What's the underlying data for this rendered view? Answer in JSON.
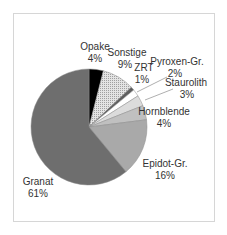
{
  "chart_data": {
    "type": "pie",
    "title": "",
    "start_angle_deg": 0,
    "direction": "clockwise",
    "slices": [
      {
        "label": "Opake",
        "value": 4,
        "pct_label": "4%",
        "color": "#000000",
        "pattern": "solid"
      },
      {
        "label": "Sonstige",
        "value": 9,
        "pct_label": "9%",
        "color": "#d0d0d0",
        "pattern": "dotted"
      },
      {
        "label": "ZRT",
        "value": 1,
        "pct_label": "1%",
        "color": "#5e5e5e",
        "pattern": "solid"
      },
      {
        "label": "Pyroxen-Gr.",
        "value": 2,
        "pct_label": "2%",
        "color": "#ffffff",
        "pattern": "solid"
      },
      {
        "label": "Staurolith",
        "value": 3,
        "pct_label": "3%",
        "color": "#dcdcdc",
        "pattern": "solid"
      },
      {
        "label": "Hornblende",
        "value": 4,
        "pct_label": "4%",
        "color": "#c0c0c0",
        "pattern": "solid"
      },
      {
        "label": "Epidot-Gr.",
        "value": 16,
        "pct_label": "16%",
        "color": "#a9a9a9",
        "pattern": "solid"
      },
      {
        "label": "Granat",
        "value": 61,
        "pct_label": "61%",
        "color": "#6e6e6e",
        "pattern": "solid"
      }
    ],
    "categories": [
      "Opake",
      "Sonstige",
      "ZRT",
      "Pyroxen-Gr.",
      "Staurolith",
      "Hornblende",
      "Epidot-Gr.",
      "Granat"
    ],
    "values": [
      4,
      9,
      1,
      2,
      3,
      4,
      16,
      61
    ],
    "legend": "none (data labels outside slices)",
    "leader_lines": [
      "Pyroxen-Gr.",
      "Staurolith"
    ]
  },
  "labels": {
    "opake": {
      "name": "Opake",
      "pct": "4%"
    },
    "sonstige": {
      "name": "Sonstige",
      "pct": "9%"
    },
    "zrt": {
      "name": "ZRT",
      "pct": "1%"
    },
    "pyroxen": {
      "name": "Pyroxen-Gr.",
      "pct": "2%"
    },
    "staurolith": {
      "name": "Staurolith",
      "pct": "3%"
    },
    "hornblende": {
      "name": "Hornblende",
      "pct": "4%"
    },
    "epidot": {
      "name": "Epidot-Gr.",
      "pct": "16%"
    },
    "granat": {
      "name": "Granat",
      "pct": "61%"
    }
  }
}
